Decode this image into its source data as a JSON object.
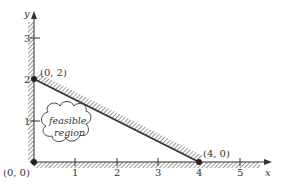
{
  "diagram": {
    "type": "linear-programming-feasible-region",
    "axes": {
      "x_label": "x",
      "y_label": "y",
      "x_ticks": [
        "1",
        "2",
        "3",
        "4",
        "5"
      ],
      "y_ticks": [
        "1",
        "2",
        "3"
      ]
    },
    "points": [
      {
        "label": "(0, 0)",
        "x": 0,
        "y": 0
      },
      {
        "label": "(0, 2)",
        "x": 0,
        "y": 2
      },
      {
        "label": "(4, 0)",
        "x": 4,
        "y": 0
      }
    ],
    "region_label_line1": "feasible",
    "region_label_line2": "region",
    "colors": {
      "ink": "#333333",
      "hatch": "#555555",
      "background": "#ffffff"
    }
  }
}
